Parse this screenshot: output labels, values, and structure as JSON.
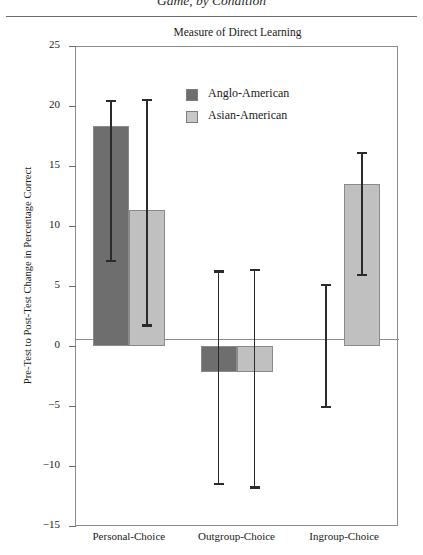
{
  "caption": "Game, by Condition",
  "chart_data": {
    "type": "bar",
    "title": "Measure of Direct Learning",
    "xlabel": "",
    "ylabel": "Pre-Test to Post-Test Change in Percentage Correct",
    "ylim": [
      -15,
      25
    ],
    "yticks": [
      25,
      20,
      15,
      10,
      5,
      0,
      -5,
      -10,
      -15
    ],
    "ytick_labels": [
      "25",
      "20",
      "15",
      "10",
      "5",
      "0",
      "−5",
      "−10",
      "−15"
    ],
    "grid": false,
    "legend_position": "upper-center",
    "categories": [
      "Personal-Choice",
      "Outgroup-Choice",
      "Ingroup-Choice"
    ],
    "series": [
      {
        "name": "Anglo-American",
        "color": "#6e6e6e",
        "values": [
          18.3,
          -2.2,
          0.0
        ],
        "error_upper": [
          20.5,
          6.3,
          5.2
        ],
        "error_lower": [
          7.2,
          -11.4,
          -5.0
        ]
      },
      {
        "name": "Asian-American",
        "color": "#c0c0c0",
        "values": [
          11.3,
          -2.2,
          13.5
        ],
        "error_upper": [
          20.6,
          6.4,
          16.2
        ],
        "error_lower": [
          1.8,
          -11.7,
          6.0
        ]
      }
    ]
  }
}
